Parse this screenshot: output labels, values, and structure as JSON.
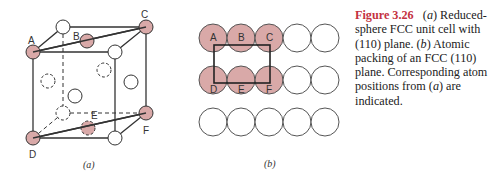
{
  "figure": {
    "number": "Figure 3.26",
    "caption_parts": [
      {
        "text": "(",
        "style": "normal"
      },
      {
        "text": "a",
        "style": "italic"
      },
      {
        "text": ") Reduced-sphere FCC unit cell with (110) plane. (",
        "style": "normal"
      },
      {
        "text": "b",
        "style": "italic"
      },
      {
        "text": ") Atomic packing of an FCC (110) plane. Corresponding atom positions from (",
        "style": "normal"
      },
      {
        "text": "a",
        "style": "italic"
      },
      {
        "text": ") are indicated.",
        "style": "normal"
      }
    ],
    "colors": {
      "figure_number": "#c4323f",
      "highlighted_atom": "#d9a9a8",
      "outline": "#333333"
    }
  },
  "panel_a": {
    "sublabel": "(a)",
    "atom_labels": {
      "A": "A",
      "B": "B",
      "C": "C",
      "D": "D",
      "E": "E",
      "F": "F"
    }
  },
  "panel_b": {
    "sublabel": "(b)",
    "rows": [
      [
        "A",
        "B",
        "C",
        "",
        ""
      ],
      [
        "D",
        "E",
        "F",
        "",
        ""
      ],
      [
        "",
        "",
        "",
        "",
        ""
      ]
    ]
  }
}
